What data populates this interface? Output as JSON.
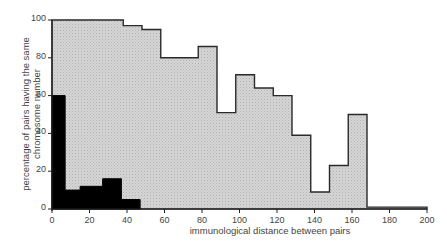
{
  "chart_data": {
    "type": "bar",
    "subtype": "overlaid step histogram",
    "title": "",
    "xlabel": "immunological distance between pairs",
    "ylabel": "percentage of pairs having the same chromosome number",
    "ylabel_lines": [
      "percentage of pairs having the same",
      "chromosome number"
    ],
    "xlim": [
      0,
      200
    ],
    "ylim": [
      0,
      100
    ],
    "x_ticks": [
      0,
      20,
      40,
      60,
      80,
      100,
      120,
      140,
      160,
      180,
      200
    ],
    "y_ticks": [
      0,
      20,
      40,
      60,
      80,
      100
    ],
    "grid": false,
    "legend": null,
    "series": [
      {
        "name": "gray (upper) histogram",
        "color": "#d0d0d0",
        "bins": [
          {
            "x0": 0,
            "x1": 38,
            "value": 100
          },
          {
            "x0": 38,
            "x1": 48,
            "value": 97
          },
          {
            "x0": 48,
            "x1": 58,
            "value": 95
          },
          {
            "x0": 58,
            "x1": 68,
            "value": 80
          },
          {
            "x0": 68,
            "x1": 78,
            "value": 80
          },
          {
            "x0": 78,
            "x1": 88,
            "value": 86
          },
          {
            "x0": 88,
            "x1": 98,
            "value": 51
          },
          {
            "x0": 98,
            "x1": 108,
            "value": 71
          },
          {
            "x0": 108,
            "x1": 118,
            "value": 64
          },
          {
            "x0": 118,
            "x1": 128,
            "value": 60
          },
          {
            "x0": 128,
            "x1": 138,
            "value": 39
          },
          {
            "x0": 138,
            "x1": 148,
            "value": 9
          },
          {
            "x0": 148,
            "x1": 158,
            "value": 23
          },
          {
            "x0": 158,
            "x1": 168,
            "value": 50
          },
          {
            "x0": 168,
            "x1": 200,
            "value": 1
          }
        ]
      },
      {
        "name": "black (lower) histogram",
        "color": "#000000",
        "bins": [
          {
            "x0": 0,
            "x1": 7,
            "value": 60
          },
          {
            "x0": 7,
            "x1": 15,
            "value": 10
          },
          {
            "x0": 15,
            "x1": 27,
            "value": 12
          },
          {
            "x0": 27,
            "x1": 37,
            "value": 16
          },
          {
            "x0": 37,
            "x1": 47,
            "value": 5
          }
        ]
      }
    ]
  },
  "plot_area": {
    "left": 52,
    "right": 427,
    "top": 20,
    "bottom": 209
  }
}
